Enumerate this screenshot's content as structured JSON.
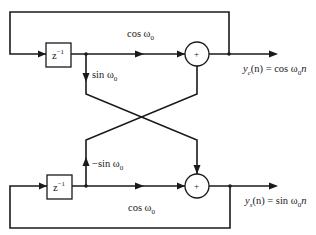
{
  "diagram": {
    "type": "block-diagram",
    "colors": {
      "line": "#1a1a1a",
      "background": "#ffffff"
    },
    "top_branch": {
      "delay": {
        "base": "z",
        "exponent": "−1"
      },
      "forward_gain": {
        "text": "cos ω",
        "sub": "0"
      },
      "cross_gain": {
        "text": "sin ω",
        "sub": "0"
      },
      "adder_symbol": "+",
      "output": {
        "y": "y",
        "y_sub": "c",
        "rest": "(n) = cos ω",
        "w_sub": "0",
        "tail": "n"
      }
    },
    "bottom_branch": {
      "delay": {
        "base": "z",
        "exponent": "−1"
      },
      "forward_gain": {
        "text": "cos ω",
        "sub": "0"
      },
      "cross_gain": {
        "text": "−sin ω",
        "sub": "0"
      },
      "adder_symbol": "+",
      "output": {
        "y": "y",
        "y_sub": "s",
        "rest": "(n) = sin ω",
        "w_sub": "0",
        "tail": "n"
      }
    }
  }
}
